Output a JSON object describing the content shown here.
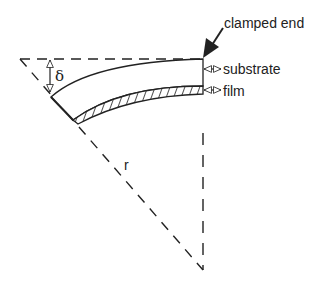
{
  "diagram": {
    "labels": {
      "clamped_end": "clamped end",
      "substrate": "substrate",
      "film": "film",
      "deflection": "δ",
      "radius": "r"
    },
    "colors": {
      "stroke": "#222222",
      "background": "#ffffff"
    }
  }
}
